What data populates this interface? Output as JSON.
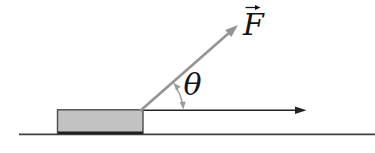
{
  "figure": {
    "labels": {
      "force": "F",
      "angle": "θ"
    },
    "colors": {
      "background": "#ffffff",
      "force_vector": "#949494",
      "angle_arc": "#9b9b9b",
      "horizontal_arrow": "#222222",
      "ground_line": "#3f3f3f",
      "block_fill": "#c2c2c2",
      "block_border": "#4a4a4a",
      "block_base_shadow": "#1f1f1f",
      "label_text": "#141414"
    }
  }
}
